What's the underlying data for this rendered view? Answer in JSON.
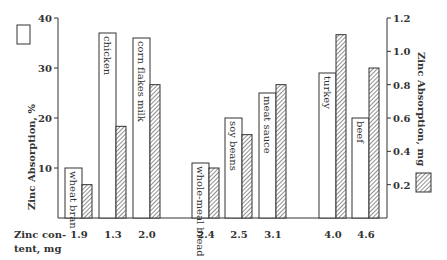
{
  "chart_data": {
    "type": "bar",
    "title": "",
    "categories": [
      "wheat bran",
      "chicken",
      "corn flakes milk",
      "whole-meal bread",
      "soy beans",
      "meat sauce",
      "turkey",
      "beef"
    ],
    "zinc_content_mg": [
      "1.9",
      "1.3",
      "2.0",
      "2.4",
      "2.5",
      "3.1",
      "4.0",
      "4.6"
    ],
    "xlabel": "Zinc content, mg",
    "xlabel_lines": [
      "Zinc con-",
      "tent, mg"
    ],
    "series": [
      {
        "name": "Zinc Absorption, %",
        "axis": "left",
        "style": "open",
        "values": [
          10,
          37,
          36,
          11,
          20,
          25,
          29,
          20
        ]
      },
      {
        "name": "Zinc Absorption, mg",
        "axis": "right",
        "style": "hatched",
        "values": [
          0.2,
          0.55,
          0.8,
          0.3,
          0.5,
          0.8,
          1.1,
          0.9
        ]
      }
    ],
    "ylabel": "Zinc Absorption, %",
    "ylim": [
      0,
      40
    ],
    "yticks": [
      "10",
      "20",
      "30",
      "40"
    ],
    "y2label": "Zinc Absorption, mg",
    "y2lim": [
      0,
      1.2
    ],
    "y2ticks": [
      "0.2",
      "0.4",
      "0.6",
      "0.8",
      "1.0",
      "1.2"
    ],
    "grid": false,
    "legend": {
      "left_box": "open bar = %",
      "right_box": "hatched bar = mg"
    }
  },
  "labels": {
    "ylabel": "Zinc Absorption, %",
    "y2label": "Zinc Absorption, mg",
    "xlabel_line1": "Zinc con-",
    "xlabel_line2": "tent, mg"
  },
  "colors": {
    "ink": "#333333",
    "bar_fill": "#ffffff",
    "background": "#ffffff"
  }
}
